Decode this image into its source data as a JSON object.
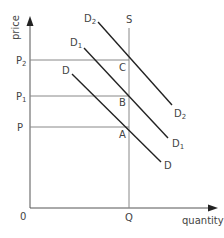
{
  "diagram": {
    "type": "supply-demand",
    "axes": {
      "y_label": "price",
      "x_label": "quantity",
      "origin": "0"
    },
    "price_levels": [
      {
        "label": "P",
        "sub": "2",
        "point": "C"
      },
      {
        "label": "P",
        "sub": "1",
        "point": "B"
      },
      {
        "label": "P",
        "sub": "",
        "point": "A"
      }
    ],
    "quantity_level": {
      "label": "Q"
    },
    "supply": {
      "label": "S"
    },
    "demand_curves": [
      {
        "label": "D",
        "sub": "2"
      },
      {
        "label": "D",
        "sub": "1"
      },
      {
        "label": "D",
        "sub": ""
      }
    ],
    "points": [
      "C",
      "B",
      "A"
    ],
    "colors": {
      "curve": "#222222",
      "guide": "#888888",
      "axis": "#555555",
      "text": "#444444"
    }
  }
}
